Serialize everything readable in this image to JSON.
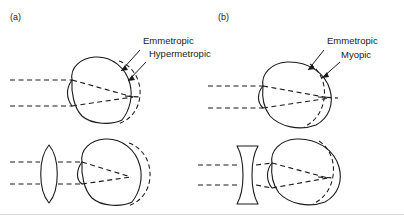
{
  "figure": {
    "background_color": "#ffffff",
    "ink_color": "#1a1a1a",
    "width": 404,
    "height": 218
  },
  "panels": [
    {
      "tag": "(a)",
      "condition": "Hypermetropic",
      "labels": [
        {
          "text": "Emmetropic",
          "name": "emmetropic-label"
        },
        {
          "text": "Hypermetropic",
          "name": "hypermetropic-label"
        }
      ],
      "uncorrected": {
        "name": "hypermetropic-eye-uncorrected",
        "description": "Emmetropic eye outline solid; hypermetropic (too short) eye shown dashed, focal point falls behind the retina"
      },
      "corrected": {
        "name": "hypermetropic-eye-corrected",
        "lens_type": "convex",
        "lens_name": "convex-lens",
        "description": "Converging biconvex spectacle lens brings the focus forward onto the retina"
      },
      "rays": {
        "count": 2,
        "style": "dashed",
        "direction": "left-to-right"
      }
    },
    {
      "tag": "(b)",
      "condition": "Myopic",
      "labels": [
        {
          "text": "Emmetropic",
          "name": "emmetropic-label"
        },
        {
          "text": "Myopic",
          "name": "myopic-label"
        }
      ],
      "uncorrected": {
        "name": "myopic-eye-uncorrected",
        "description": "Emmetropic eye outline solid; myopic (too long) eye shown dashed, focal point falls in front of the retina"
      },
      "corrected": {
        "name": "myopic-eye-corrected",
        "lens_type": "concave",
        "lens_name": "concave-lens",
        "description": "Diverging biconcave spectacle lens pushes the focus back onto the retina"
      },
      "rays": {
        "count": 2,
        "style": "dashed",
        "direction": "left-to-right"
      }
    }
  ]
}
